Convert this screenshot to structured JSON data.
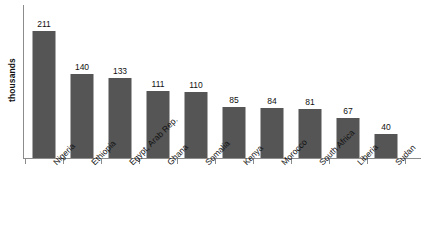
{
  "chart_data": {
    "type": "bar",
    "title": "",
    "subtitle": "",
    "xlabel": "",
    "ylabel": "thousands",
    "categories": [
      "Nigeria",
      "Ethiopia",
      "Egypt, Arab Rep.",
      "Ghana",
      "Somalia",
      "Kenya",
      "Morocco",
      "South Africa",
      "Liberia",
      "Sudan"
    ],
    "values": [
      211,
      140,
      133,
      111,
      110,
      85,
      84,
      81,
      67,
      40
    ],
    "value_labels": [
      "211",
      "140",
      "133",
      "111",
      "110",
      "85",
      "84",
      "81",
      "67",
      "40"
    ],
    "ylim": [
      0,
      255
    ],
    "grid": false,
    "legend": false,
    "y_tick_labels": [],
    "bar_color": "#555555",
    "axis_color": "#8c8c8c",
    "text_color": "#111111",
    "background": "#ffffff"
  },
  "axis": {
    "y_title": "thousands"
  }
}
